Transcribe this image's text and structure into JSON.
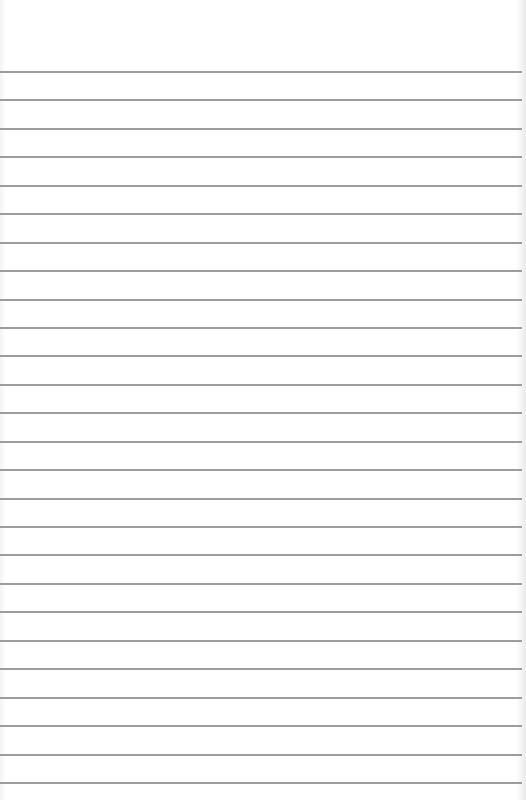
{
  "page": {
    "type": "ruled-notepad-page",
    "background_color": "#ffffff",
    "rule_color": "#8c8c8c",
    "first_rule_y": 71,
    "rule_spacing": 28.44,
    "rule_count": 26
  }
}
